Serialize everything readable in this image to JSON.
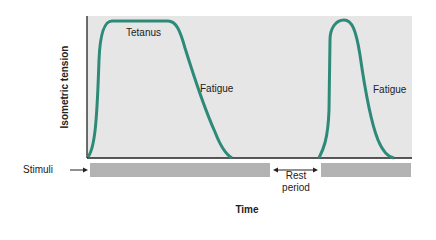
{
  "chart_data": {
    "type": "line",
    "title": "",
    "xlabel": "Time",
    "ylabel": "Isometric tension",
    "annotations": [
      "Tetanus",
      "Fatigue",
      "Fatigue",
      "Rest period"
    ],
    "series": [
      {
        "name": "Isometric tension (first stimulation)",
        "label_plateau": "Tetanus",
        "label_decline": "Fatigue",
        "description": "Rapid rise to maximal sustained tetanic tension, plateau, then gradual decline (fatigue) to zero while stimuli continue"
      },
      {
        "name": "Isometric tension (after rest)",
        "label_decline": "Fatigue",
        "description": "After rest period, tension rises to near-max briefly then fatigues faster"
      }
    ],
    "stimuli": {
      "label": "Stimuli",
      "segments": 2,
      "gap_label": "Rest period"
    },
    "grid": false,
    "colors": {
      "curve": "#2e8a78",
      "plot_bg": "#e6e6e6",
      "axis": "#222222"
    }
  },
  "labels": {
    "ylabel": "Isometric tension",
    "xlabel": "Time",
    "tetanus": "Tetanus",
    "fatigue1": "Fatigue",
    "fatigue2": "Fatigue",
    "stimuli": "Stimuli",
    "rest_line1": "Rest",
    "rest_line2": "period"
  }
}
